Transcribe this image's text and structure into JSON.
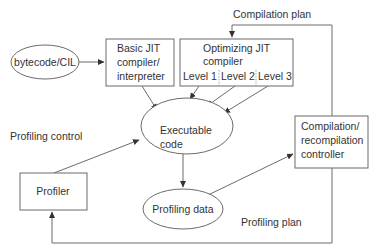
{
  "diagram": {
    "colors": {
      "stroke": "#6b6b6b",
      "text": "#333333",
      "background": "#ffffff"
    },
    "nodes": {
      "bytecode": {
        "label": "bytecode/CIL",
        "shape": "ellipse"
      },
      "basic_jit": {
        "line1": "Basic JIT",
        "line2": "compiler/",
        "line3": "interpreter",
        "shape": "rectangle"
      },
      "optimizing_jit": {
        "line1": "Optimizing JIT",
        "line2": "compiler",
        "shape": "rectangle",
        "levels": [
          "Level 1",
          "Level 2",
          "Level 3"
        ]
      },
      "executable_code": {
        "line1": "Executable",
        "line2": "code",
        "shape": "ellipse"
      },
      "profiling_data": {
        "label": "Profiling data",
        "shape": "ellipse"
      },
      "controller": {
        "line1": "Compilation/",
        "line2": "recompilation",
        "line3": "controller",
        "shape": "rectangle"
      },
      "profiler": {
        "label": "Profiler",
        "shape": "rectangle"
      }
    },
    "edge_labels": {
      "compilation_plan": "Compilation plan",
      "profiling_control": "Profiling control",
      "profiling_plan": "Profiling plan"
    },
    "edges": [
      {
        "from": "bytecode/CIL",
        "to": "Basic JIT compiler/interpreter"
      },
      {
        "from": "Basic JIT compiler/interpreter",
        "to": "Executable code"
      },
      {
        "from": "Level 1",
        "to": "Executable code"
      },
      {
        "from": "Level 2",
        "to": "Executable code"
      },
      {
        "from": "Level 3",
        "to": "Executable code"
      },
      {
        "from": "Executable code",
        "to": "Profiling data"
      },
      {
        "from": "Profiling data",
        "to": "Compilation/recompilation controller"
      },
      {
        "from": "Compilation/recompilation controller",
        "to": "Optimizing JIT compiler",
        "label": "Compilation plan"
      },
      {
        "from": "Compilation/recompilation controller",
        "to": "Profiler",
        "label": "Profiling plan"
      },
      {
        "from": "Profiler",
        "to": "Executable code",
        "label": "Profiling control"
      }
    ]
  }
}
